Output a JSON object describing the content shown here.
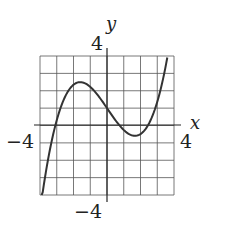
{
  "chart_data": {
    "type": "line",
    "title": "",
    "xlabel": "x",
    "ylabel": "y",
    "xlim": [
      -4,
      4
    ],
    "ylim": [
      -4,
      4
    ],
    "grid": true,
    "grid_step": 1,
    "tick_labels": {
      "x": [
        {
          "value": -4,
          "label": "-4"
        },
        {
          "value": 4,
          "label": "4"
        }
      ],
      "y": [
        {
          "value": 4,
          "label": "4"
        },
        {
          "value": -4,
          "label": "-4"
        }
      ]
    },
    "series": [
      {
        "name": "f(x)",
        "description": "cubic with local max near (-1.6, 2.5), local min near (1.7, -0.7), y-intercept 1",
        "x": [
          -3.9,
          -3.6,
          -3.3,
          -3.0,
          -2.7,
          -2.4,
          -2.1,
          -1.8,
          -1.5,
          -1.2,
          -0.9,
          -0.6,
          -0.3,
          0.0,
          0.3,
          0.6,
          0.9,
          1.2,
          1.5,
          1.8,
          2.1,
          2.4,
          2.7,
          3.0,
          3.3,
          3.6
        ],
        "y": [
          -4.26,
          -2.78,
          -1.54,
          -0.53,
          0.28,
          0.98,
          1.68,
          2.4,
          2.5,
          2.41,
          2.14,
          1.81,
          1.41,
          1.0,
          0.57,
          0.14,
          -0.25,
          -0.53,
          -0.68,
          -0.68,
          -0.52,
          -0.16,
          0.41,
          1.15,
          2.1,
          3.9
        ]
      }
    ],
    "extrema": {
      "local_max": [
        -1.6,
        2.5
      ],
      "local_min": [
        1.7,
        -0.7
      ]
    }
  },
  "labels": {
    "x_axis": "x",
    "y_axis": "y",
    "x_min": "−4",
    "x_max": "4",
    "y_max": "4",
    "y_min": "−4"
  }
}
